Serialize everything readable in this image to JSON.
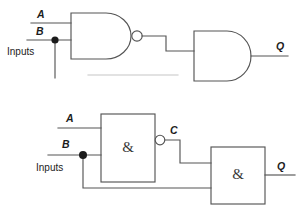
{
  "figure": {
    "background_color": "#ffffff",
    "line_color": "#555555",
    "text_color": "#1c1c1c",
    "junction_color": "#1b1b1b"
  },
  "diagram_top": {
    "name": "distinctive-shape-symbols",
    "labels": {
      "input_a": "A",
      "input_b": "B",
      "inputs": "Inputs",
      "output_q": "Q"
    },
    "gates": [
      {
        "id": "gate1",
        "type": "nand",
        "symbol_style": "distinctive-shape",
        "inverted_output": true,
        "inputs": [
          "A",
          "B"
        ]
      },
      {
        "id": "gate2",
        "type": "and",
        "symbol_style": "distinctive-shape",
        "inverted_output": false,
        "inputs": [
          "gate1",
          "B"
        ]
      }
    ]
  },
  "diagram_bottom": {
    "name": "rectangular-iec-symbols",
    "labels": {
      "input_a": "A",
      "input_b": "B",
      "inputs": "Inputs",
      "node_c": "C",
      "output_q": "Q",
      "gate_symbol": "&"
    },
    "gates": [
      {
        "id": "gate1",
        "type": "nand",
        "symbol_style": "rectangular",
        "body_text": "&",
        "inverted_output": true,
        "inputs": [
          "A",
          "B"
        ],
        "output_label": "C"
      },
      {
        "id": "gate2",
        "type": "and",
        "symbol_style": "rectangular",
        "body_text": "&",
        "inverted_output": false,
        "inputs": [
          "C",
          "B"
        ],
        "output_label": "Q"
      }
    ]
  }
}
